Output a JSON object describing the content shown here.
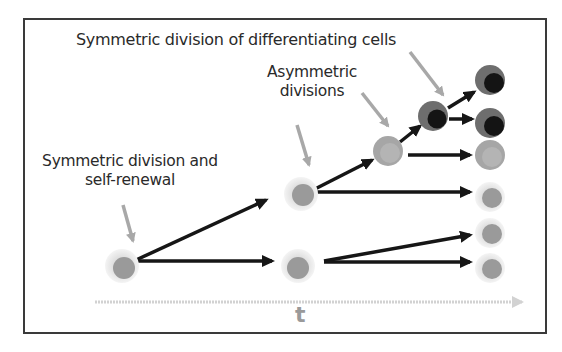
{
  "diagram": {
    "labels": {
      "differentiating": "Symmetric division of differentiating cells",
      "asymmetric_line1": "Asymmetric",
      "asymmetric_line2": "divisions",
      "self_renewal_line1": "Symmetric division and",
      "self_renewal_line2": "self-renewal",
      "time_axis": "t"
    },
    "colors": {
      "stem_halo": "#e3e3e3",
      "stem_core": "#9a9a9a",
      "progenitor_outer": "#a6a6a6",
      "progenitor_core": "#b4b4b4",
      "differentiated_outer": "#6e6e6e",
      "differentiated_core": "#141414",
      "arrow_dark": "#161616",
      "pointer_gray": "#a8a8a8",
      "time_axis": "#d2d2d2",
      "frame": "#3a3a3a"
    },
    "cells": [
      {
        "id": "origin-stem",
        "type": "stem",
        "x": 122,
        "y": 266
      },
      {
        "id": "gen1-upper-stem",
        "type": "stem",
        "x": 301,
        "y": 194
      },
      {
        "id": "gen1-lower-stem",
        "type": "stem",
        "x": 298,
        "y": 266
      },
      {
        "id": "asymmetric-progenitor",
        "type": "progenitor",
        "x": 388,
        "y": 151
      },
      {
        "id": "differentiating-cell",
        "type": "differentiated",
        "x": 433,
        "y": 116
      },
      {
        "id": "final-1",
        "type": "differentiated",
        "x": 490,
        "y": 80
      },
      {
        "id": "final-2",
        "type": "differentiated",
        "x": 490,
        "y": 123
      },
      {
        "id": "final-3",
        "type": "progenitor",
        "x": 490,
        "y": 155
      },
      {
        "id": "final-4",
        "type": "stem",
        "x": 490,
        "y": 197
      },
      {
        "id": "final-5",
        "type": "stem",
        "x": 490,
        "y": 233
      },
      {
        "id": "final-6",
        "type": "stem",
        "x": 490,
        "y": 268
      }
    ]
  }
}
